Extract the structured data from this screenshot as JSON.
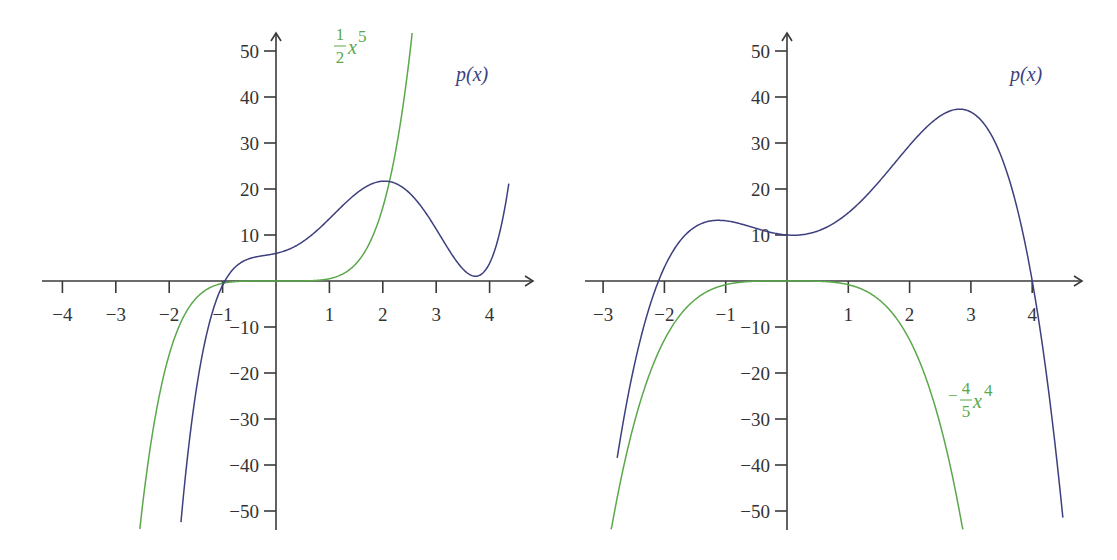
{
  "colors": {
    "p_curve": "#3d3f7e",
    "leading_term": "#5aa84a",
    "axis": "#3a3a3a",
    "text": "#333333"
  },
  "chart_data": [
    {
      "type": "line",
      "title": "",
      "xlabel": "",
      "ylabel": "",
      "xlim": [
        -4.3,
        4.8
      ],
      "ylim": [
        -54,
        54
      ],
      "grid": false,
      "x_ticks": [
        -4,
        -3,
        -2,
        -1,
        1,
        2,
        3,
        4
      ],
      "x_tick_labels": [
        "−4",
        "−3",
        "−2",
        "−1",
        "1",
        "2",
        "3",
        "4"
      ],
      "y_ticks": [
        50,
        40,
        30,
        20,
        10,
        -10,
        -20,
        -30,
        -40,
        -50
      ],
      "y_tick_labels": [
        "50",
        "40",
        "30",
        "20",
        "10",
        "−10",
        "−20",
        "−30",
        "−40",
        "−50"
      ],
      "series": [
        {
          "name": "p(x)",
          "label": "p(x)",
          "color": "#3d3f7e",
          "description": "degree-5 polynomial, roots ≈ -1, 2, 3.75; local max ≈ 7 near x=-0.4; local min ≈ -11 near x=3.2",
          "form": "0.5(x+1)(x-2)(x-3.75)(x^2-0.9x+1.6)",
          "x_range": [
            -1.78,
            4.36
          ],
          "points": [
            [
              -1.5,
              -32
            ],
            [
              -1,
              0
            ],
            [
              -0.4,
              6.5
            ],
            [
              0,
              6
            ],
            [
              1,
              4.1
            ],
            [
              1.5,
              3.4
            ],
            [
              2,
              0
            ],
            [
              2.5,
              -5
            ],
            [
              3.2,
              -11
            ],
            [
              3.75,
              0
            ],
            [
              4.2,
              40
            ]
          ]
        },
        {
          "name": "1/2 x^5",
          "label_num": "1",
          "label_den": "2",
          "label_var": "x",
          "label_exp": "5",
          "color": "#5aa84a",
          "form": "0.5x^5",
          "x_range": [
            -2.55,
            2.55
          ],
          "points": [
            [
              -2.5,
              -48.8
            ],
            [
              -2,
              -16
            ],
            [
              -1,
              -0.5
            ],
            [
              0,
              0
            ],
            [
              1,
              0.5
            ],
            [
              2,
              16
            ],
            [
              2.5,
              48.8
            ]
          ]
        }
      ]
    },
    {
      "type": "line",
      "title": "",
      "xlabel": "",
      "ylabel": "",
      "xlim": [
        -3.3,
        4.9
      ],
      "ylim": [
        -54,
        54
      ],
      "grid": false,
      "x_ticks": [
        -3,
        -2,
        -1,
        1,
        2,
        3,
        4
      ],
      "x_tick_labels": [
        "−3",
        "−2",
        "−1",
        "1",
        "2",
        "3",
        "4"
      ],
      "y_ticks": [
        50,
        40,
        30,
        20,
        10,
        -10,
        -20,
        -30,
        -40,
        -50
      ],
      "y_tick_labels": [
        "50",
        "40",
        "30",
        "20",
        "10",
        "−10",
        "−20",
        "−30",
        "−40",
        "−50"
      ],
      "series": [
        {
          "name": "p(x)",
          "label": "p(x)",
          "color": "#3d3f7e",
          "description": "degree-4 polynomial, roots ≈ -1.8, 4.2; plateau ≈ 9.5 near x=-0.7; p(0)=10; local max ≈ 48.5 near x=2.95",
          "form": "-0.8(x+1.8)(x-4.2)(x^2-0.05x+1.653)",
          "x_range": [
            -2.77,
            4.5
          ],
          "points": [
            [
              -2.5,
              -30
            ],
            [
              -1.8,
              0
            ],
            [
              -1,
              9
            ],
            [
              0,
              10
            ],
            [
              1,
              17
            ],
            [
              2,
              35
            ],
            [
              2.95,
              48.5
            ],
            [
              4,
              15
            ],
            [
              4.2,
              0
            ],
            [
              4.5,
              -32
            ]
          ]
        },
        {
          "name": "-4/5 x^4",
          "label_sign": "−",
          "label_num": "4",
          "label_den": "5",
          "label_var": "x",
          "label_exp": "4",
          "color": "#5aa84a",
          "form": "-0.8x^4",
          "x_range": [
            -2.87,
            2.87
          ],
          "points": [
            [
              -2.8,
              -49.2
            ],
            [
              -2,
              -12.8
            ],
            [
              -1,
              -0.8
            ],
            [
              0,
              0
            ],
            [
              1,
              -0.8
            ],
            [
              2,
              -12.8
            ],
            [
              2.8,
              -49.2
            ]
          ]
        }
      ]
    }
  ],
  "plots": [
    {
      "origin_px": [
        276,
        281
      ],
      "x_unit_px": 53.4,
      "y_unit_px": 4.6,
      "x_axis_px": [
        42,
        533
      ],
      "y_axis_px": [
        530,
        33
      ],
      "curves": [
        {
          "coef": "p5",
          "c": [
            0.5,
            -3.3,
            4.1,
            3.61,
            2.63,
            6.0
          ],
          "x0": -1.78,
          "x1": 4.36,
          "color": "#3d3f7e"
        },
        {
          "coef": "g5",
          "c": [
            0.5,
            0,
            0,
            0,
            0,
            0
          ],
          "x0": -2.55,
          "x1": 2.55,
          "color": "#5aa84a"
        }
      ]
    },
    {
      "origin_px": [
        787,
        281
      ],
      "x_unit_px": 61.3,
      "y_unit_px": 4.6,
      "x_axis_px": [
        585,
        1082
      ],
      "y_axis_px": [
        530,
        33
      ],
      "curves": [
        {
          "coef": "p4",
          "c": [
            -0.8,
            1.92,
            4.76,
            -1.05,
            10.0
          ],
          "x0": -2.77,
          "x1": 4.5,
          "color": "#3d3f7e"
        },
        {
          "coef": "g4",
          "c": [
            -0.8,
            0,
            0,
            0,
            0
          ],
          "x0": -2.87,
          "x1": 2.87,
          "color": "#5aa84a"
        }
      ]
    }
  ]
}
